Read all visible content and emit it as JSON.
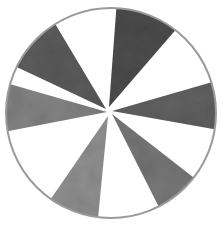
{
  "artwork": {
    "title": "Watercolor wheel with six gray wedges",
    "background_color": "#ffffff",
    "outline_color": "#9a9a9a",
    "wedge_count": 6,
    "wedges": [
      {
        "name": "upper-left-wedge",
        "color": "#5e5e5e",
        "shade": "dark"
      },
      {
        "name": "top-right-wedge",
        "color": "#4f4f4f",
        "shade": "darkest"
      },
      {
        "name": "right-wedge",
        "color": "#636363",
        "shade": "dark"
      },
      {
        "name": "lower-right-wedge",
        "color": "#7a7a7a",
        "shade": "medium"
      },
      {
        "name": "bottom-wedge",
        "color": "#929292",
        "shade": "light"
      },
      {
        "name": "left-wedge",
        "color": "#858585",
        "shade": "medium"
      }
    ]
  }
}
